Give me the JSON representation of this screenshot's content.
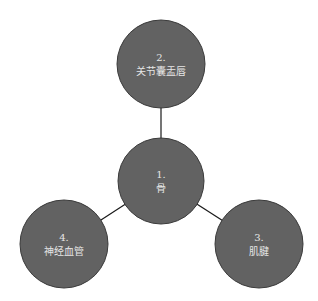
{
  "diagram": {
    "type": "hub-and-spoke",
    "colors": {
      "background": "#ffffff",
      "node_fill": "#626262",
      "node_stroke": "#3a3a3a",
      "edge": "#1a1a1a",
      "label": "#e6e6e6"
    },
    "nodes": [
      {
        "id": "1",
        "number": "1.",
        "label": "骨",
        "cx": 161,
        "cy": 181,
        "r": 43
      },
      {
        "id": "2",
        "number": "2.",
        "label": "关节囊盂唇",
        "cx": 161,
        "cy": 64,
        "r": 44
      },
      {
        "id": "3",
        "number": "3.",
        "label": "肌腱",
        "cx": 259,
        "cy": 244,
        "r": 44
      },
      {
        "id": "4",
        "number": "4.",
        "label": "神经血管",
        "cx": 64,
        "cy": 244,
        "r": 44
      }
    ],
    "edges": [
      {
        "from": "1",
        "to": "2"
      },
      {
        "from": "1",
        "to": "3"
      },
      {
        "from": "1",
        "to": "4"
      }
    ]
  }
}
